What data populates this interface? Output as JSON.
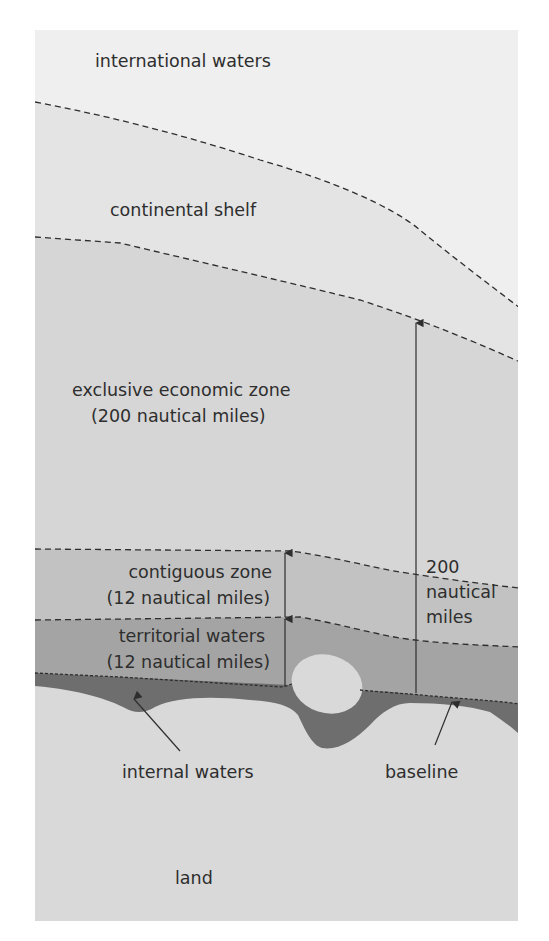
{
  "diagram": {
    "colors": {
      "background": "#ffffff",
      "international_waters": "#efefef",
      "continental_shelf": "#e4e4e4",
      "eez": "#d6d6d6",
      "contiguous_zone": "#c2c2c2",
      "territorial_waters": "#a4a4a4",
      "internal_waters": "#6e6e6e",
      "land": "#d9d9d9",
      "line": "#2e2e2e",
      "text": "#2e2e2e"
    },
    "labels": {
      "international_waters": "international waters",
      "continental_shelf": "continental shelf",
      "eez_line1": "exclusive economic zone",
      "eez_line2": "(200 nautical miles)",
      "contiguous_line1": "contiguous zone",
      "contiguous_line2": "(12 nautical miles)",
      "territorial_line1": "territorial waters",
      "territorial_line2": "(12 nautical miles)",
      "measure_line1": "200",
      "measure_line2": "nautical",
      "measure_line3": "miles",
      "internal_waters": "internal waters",
      "baseline": "baseline",
      "land": "land"
    }
  }
}
